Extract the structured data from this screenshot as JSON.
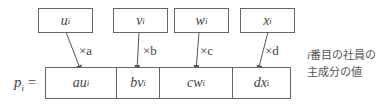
{
  "diagram": {
    "inputs": [
      {
        "label": "u",
        "sub": "i"
      },
      {
        "label": "v",
        "sub": "i"
      },
      {
        "label": "w",
        "sub": "i"
      },
      {
        "label": "x",
        "sub": "i"
      }
    ],
    "multipliers": [
      "×a",
      "×b",
      "×c",
      "×d"
    ],
    "result_label": "p",
    "result_sub": "i",
    "result_eq": " =",
    "result_cells": [
      {
        "coef": "a",
        "var": "u",
        "sub": "i"
      },
      {
        "coef": "b",
        "var": "v",
        "sub": "i"
      },
      {
        "coef": "c",
        "var": "w",
        "sub": "i"
      },
      {
        "coef": "d",
        "var": "x",
        "sub": "i"
      }
    ],
    "note_line1_italic": "i",
    "note_line1": "番目の社員の",
    "note_line2": "主成分の値"
  },
  "colors": {
    "line": "#666666",
    "text": "#444444"
  }
}
